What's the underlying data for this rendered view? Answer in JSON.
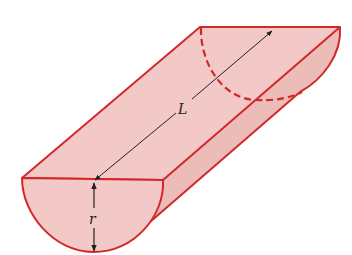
{
  "diagram": {
    "labels": {
      "length": "L",
      "radius": "r"
    },
    "colors": {
      "outline": "#d2282a",
      "fill": "#f2c9c6",
      "fill_dark": "#ecbcb8",
      "dimension_line": "#222222"
    },
    "elements": [
      {
        "name": "front-semicircle-face",
        "type": "half-disk"
      },
      {
        "name": "top-rectangular-face",
        "type": "rectangle"
      },
      {
        "name": "curved-side-surface",
        "type": "cylindrical-surface"
      },
      {
        "name": "back-hidden-arc",
        "type": "dashed-arc"
      },
      {
        "name": "length-dimension",
        "label": "L",
        "type": "double-arrow"
      },
      {
        "name": "radius-dimension",
        "label": "r",
        "type": "double-arrow"
      }
    ]
  }
}
